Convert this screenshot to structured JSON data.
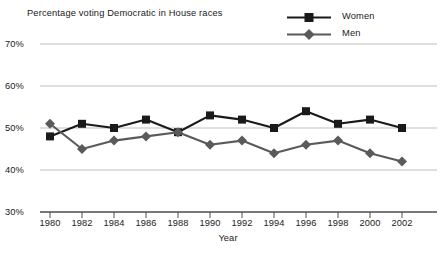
{
  "chart_data": {
    "type": "line",
    "title": "Percentage voting Democratic in House races",
    "xlabel": "Year",
    "ylabel": "",
    "x": [
      1980,
      1982,
      1984,
      1986,
      1988,
      1990,
      1992,
      1994,
      1996,
      1998,
      2000,
      2002
    ],
    "categories": [
      "1980",
      "1982",
      "1984",
      "1986",
      "1988",
      "1990",
      "1992",
      "1994",
      "1996",
      "1998",
      "2000",
      "2002"
    ],
    "series": [
      {
        "name": "Women",
        "marker": "square",
        "color": "#1a1a1a",
        "values": [
          48,
          51,
          50,
          52,
          49,
          53,
          52,
          50,
          54,
          51,
          52,
          50
        ]
      },
      {
        "name": "Men",
        "marker": "diamond",
        "color": "#5a5a5a",
        "values": [
          51,
          45,
          47,
          48,
          49,
          46,
          47,
          44,
          46,
          47,
          44,
          42
        ]
      }
    ],
    "ylim": [
      30,
      70
    ],
    "xlim": [
      1979,
      2003
    ],
    "yticks": [
      30,
      40,
      50,
      60,
      70
    ],
    "ytick_labels": [
      "30%",
      "40%",
      "50%",
      "60%",
      "70%"
    ],
    "grid": true,
    "grid_color": "#b8b8b8",
    "legend_position": "top-right",
    "axis_color": "#4d4d4d"
  },
  "legend": {
    "items": [
      {
        "label": "Women",
        "marker": "square",
        "color": "#1a1a1a"
      },
      {
        "label": "Men",
        "marker": "diamond",
        "color": "#5a5a5a"
      }
    ]
  }
}
